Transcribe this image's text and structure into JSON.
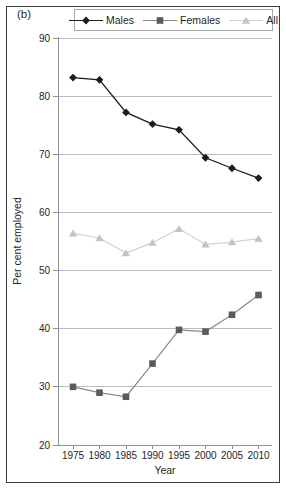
{
  "figure_label": "(b)",
  "legend": {
    "items": [
      {
        "label": "Males",
        "marker": "diamond",
        "line_color": "#1c1c1c",
        "marker_color": "#1c1c1c"
      },
      {
        "label": "Females",
        "marker": "square",
        "line_color": "#8a8a8a",
        "marker_color": "#5b5b5b"
      },
      {
        "label": "All",
        "marker": "triangle",
        "line_color": "#d2d2d2",
        "marker_color": "#c4c4c4"
      }
    ]
  },
  "chart_data": {
    "type": "line",
    "title": "",
    "xlabel": "Year",
    "ylabel": "Per cent employed",
    "x": [
      1975,
      1980,
      1985,
      1990,
      1995,
      2000,
      2005,
      2010
    ],
    "series": [
      {
        "name": "Males",
        "marker": "diamond",
        "values": [
          83.2,
          82.8,
          77.2,
          75.2,
          74.2,
          69.4,
          67.6,
          65.9
        ]
      },
      {
        "name": "Females",
        "marker": "square",
        "values": [
          30.0,
          29.0,
          28.3,
          34.0,
          39.8,
          39.5,
          42.4,
          45.8
        ]
      },
      {
        "name": "All",
        "marker": "triangle",
        "values": [
          56.4,
          55.6,
          53.0,
          54.8,
          57.2,
          54.5,
          54.9,
          55.5
        ]
      }
    ],
    "ylim": [
      20,
      90
    ],
    "yticks": [
      20,
      30,
      40,
      50,
      60,
      70,
      80,
      90
    ],
    "grid": true,
    "legend_position": "top"
  },
  "colors": {
    "grid": "#bdbdbd",
    "axis": "#8f8f8f",
    "text": "#262626",
    "figure_border": "#3c3c3c",
    "legend_border": "#a8a8a8",
    "background": "#ffffff"
  }
}
